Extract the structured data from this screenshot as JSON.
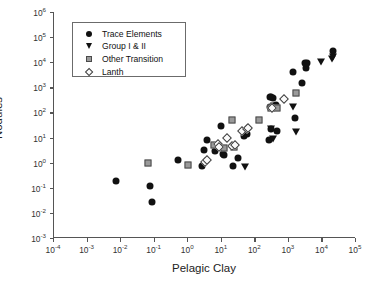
{
  "chart_data": {
    "type": "scatter",
    "title": "",
    "xlabel": "Pelagic Clay",
    "ylabel": "Nodules",
    "xscale": "log",
    "yscale": "log",
    "xlim": [
      0.0001,
      100000
    ],
    "ylim": [
      0.001,
      1000000
    ],
    "grid": false,
    "legend_position": "upper-left",
    "xticks": [
      "10-4",
      "10-3",
      "10-2",
      "10-1",
      "100",
      "101",
      "102",
      "103",
      "104",
      "105"
    ],
    "xtick_labels": [
      {
        "base": "10",
        "exp": "-4"
      },
      {
        "base": "10",
        "exp": "-3"
      },
      {
        "base": "10",
        "exp": "-2"
      },
      {
        "base": "10",
        "exp": "-1"
      },
      {
        "base": "10",
        "exp": "0"
      },
      {
        "base": "10",
        "exp": "1"
      },
      {
        "base": "10",
        "exp": "2"
      },
      {
        "base": "10",
        "exp": "3"
      },
      {
        "base": "10",
        "exp": "4"
      },
      {
        "base": "10",
        "exp": "5"
      }
    ],
    "ytick_labels": [
      {
        "base": "10",
        "exp": "6"
      },
      {
        "base": "10",
        "exp": "5"
      },
      {
        "base": "10",
        "exp": "4"
      },
      {
        "base": "10",
        "exp": "3"
      },
      {
        "base": "10",
        "exp": "2"
      },
      {
        "base": "10",
        "exp": "1"
      },
      {
        "base": "10",
        "exp": "0"
      },
      {
        "base": "10",
        "exp": "-1"
      },
      {
        "base": "10",
        "exp": "-2"
      },
      {
        "base": "10",
        "exp": "-3"
      }
    ],
    "series": [
      {
        "name": "Trace Elements",
        "marker": "circle",
        "color": "#111111",
        "points": [
          [
            0.007,
            0.19
          ],
          [
            0.075,
            0.12
          ],
          [
            0.085,
            0.026
          ],
          [
            0.5,
            1.3
          ],
          [
            2.6,
            0.72
          ],
          [
            3.0,
            3.2
          ],
          [
            3.6,
            8.0
          ],
          [
            6.5,
            2.8
          ],
          [
            9.5,
            30.0
          ],
          [
            11.0,
            2.3
          ],
          [
            11.5,
            2.0
          ],
          [
            21.0,
            0.75
          ],
          [
            30.0,
            1.5
          ],
          [
            45.0,
            12.0
          ],
          [
            55.0,
            14.0
          ],
          [
            260.0,
            8.0
          ],
          [
            270.0,
            160.0
          ],
          [
            280.0,
            400.0
          ],
          [
            290.0,
            420.0
          ],
          [
            300.0,
            21.0
          ],
          [
            330.0,
            380.0
          ],
          [
            400.0,
            200.0
          ],
          [
            430.0,
            19.0
          ],
          [
            1300.0,
            4000.0
          ],
          [
            1500.0,
            60.0
          ],
          [
            2400.0,
            1500.0
          ],
          [
            3100.0,
            9000.0
          ],
          [
            3300.0,
            6000.0
          ],
          [
            3400.0,
            9500.0
          ],
          [
            20000.0,
            28000.0
          ]
        ]
      },
      {
        "name": "Group I & II",
        "marker": "triangle-down",
        "color": "#111111",
        "points": [
          [
            48.0,
            0.65
          ],
          [
            300.0,
            22.0
          ],
          [
            330.0,
            9.0
          ],
          [
            360.0,
            175.0
          ],
          [
            1300.0,
            170.0
          ],
          [
            1600.0,
            17.0
          ],
          [
            9000.0,
            10000.0
          ],
          [
            19000.0,
            14000.0
          ],
          [
            21000.0,
            16000.0
          ]
        ]
      },
      {
        "name": "Other Transition",
        "marker": "square",
        "color": "#9a9a9a",
        "points": [
          [
            0.0016,
            5e-07
          ],
          [
            0.0019,
            3.5e-05
          ],
          [
            0.021,
            1.9e-06
          ],
          [
            0.06,
            5e-05
          ],
          [
            0.08,
            1e-06
          ],
          [
            0.065,
            1.0
          ],
          [
            1.0,
            0.78
          ],
          [
            6.0,
            5.0
          ],
          [
            12.0,
            4.0
          ],
          [
            20.0,
            48.0
          ],
          [
            23.0,
            4.2
          ],
          [
            130.0,
            48.0
          ],
          [
            290.0,
            150.0
          ],
          [
            440.0,
            150.0
          ],
          [
            1600.0,
            600.0
          ]
        ]
      },
      {
        "name": "Lanth",
        "marker": "diamond",
        "color": "#fbfbfb",
        "points": [
          [
            3.2,
            1.1
          ],
          [
            3.6,
            1.3
          ],
          [
            7.5,
            5.5
          ],
          [
            8.0,
            4.2
          ],
          [
            14.0,
            10.0
          ],
          [
            20.0,
            4.5
          ],
          [
            24.0,
            5.0
          ],
          [
            40.0,
            18.0
          ],
          [
            55.0,
            22.0
          ],
          [
            60.0,
            24.0
          ],
          [
            310.0,
            150.0
          ],
          [
            720.0,
            330.0
          ]
        ]
      }
    ]
  },
  "legend": {
    "items": [
      {
        "label": "Trace Elements",
        "marker": "circle"
      },
      {
        "label": "Group I & II",
        "marker": "triangle-down"
      },
      {
        "label": "Other Transition",
        "marker": "square"
      },
      {
        "label": "Lanth",
        "marker": "diamond"
      }
    ]
  }
}
